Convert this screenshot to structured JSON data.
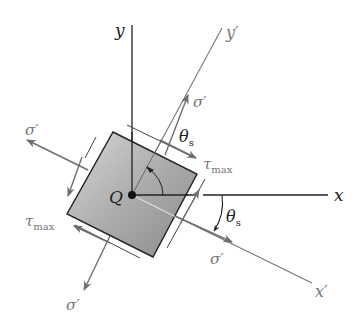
{
  "diagram": {
    "colors": {
      "axis_dark": "#222222",
      "axis_gray": "#777777",
      "arrow_gray": "#6e6e6e",
      "element_fill_light": "#d4d4d4",
      "element_fill_dark": "#8f8f8f",
      "element_edge": "#222222"
    },
    "point": {
      "label": "Q"
    },
    "axes": {
      "x": {
        "label": "x"
      },
      "y": {
        "label": "y"
      },
      "x_prime": {
        "label": "x′"
      },
      "y_prime": {
        "label": "y′"
      }
    },
    "angles": {
      "theta_top": {
        "symbol": "θ",
        "subscript": "s"
      },
      "theta_right": {
        "symbol": "θ",
        "subscript": "s"
      }
    },
    "stresses": {
      "sigma_top": {
        "label": "σ′"
      },
      "sigma_left": {
        "label": "σ′"
      },
      "sigma_right": {
        "label": "σ′"
      },
      "sigma_bottom": {
        "label": "σ′"
      },
      "tau_right": {
        "symbol": "τ",
        "subscript": "max"
      },
      "tau_left": {
        "symbol": "τ",
        "subscript": "max"
      }
    }
  }
}
